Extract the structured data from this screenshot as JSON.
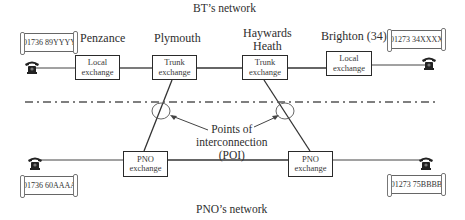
{
  "diagram": {
    "top_network_label": "BT’s network",
    "bottom_network_label": "PNO’s network",
    "places": {
      "penzance": "Penzance",
      "plymouth": "Plymouth",
      "haywards_heath_line1": "Haywards",
      "haywards_heath_line2": "Heath",
      "brighton": "Brighton (34)"
    },
    "boxes": {
      "penzance_local": [
        "Local",
        "exchange"
      ],
      "plymouth_trunk": [
        "Trunk",
        "exchange"
      ],
      "haywards_trunk": [
        "Trunk",
        "exchange"
      ],
      "brighton_local": [
        "Local",
        "exchange"
      ],
      "pno_left": [
        "PNO",
        "exchange"
      ],
      "pno_right": [
        "PNO",
        "exchange"
      ]
    },
    "phone_numbers": {
      "top_left": "01736 89YYYY",
      "top_right": "01273 34XXXX",
      "bottom_left": "01736 60AAAA",
      "bottom_right": "01273 75BBBB"
    },
    "poi_label": [
      "Points of",
      "interconnection",
      "(POI)"
    ],
    "icons": [
      "telephone-icon",
      "scroll-label",
      "poi-circle",
      "arrow"
    ],
    "colors": {
      "line": "#2a2a2a",
      "text": "#2e2e2e",
      "background": "#ffffff"
    }
  }
}
